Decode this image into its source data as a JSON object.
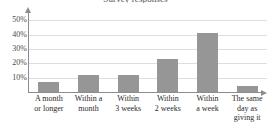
{
  "chart_data": {
    "type": "bar",
    "title": "Survey responses",
    "xlabel": "",
    "ylabel": "",
    "ylim": [
      0,
      55
    ],
    "grid": true,
    "legend": false,
    "y_ticks": [
      "10%",
      "20%",
      "30%",
      "40%",
      "50%"
    ],
    "y_tick_values": [
      10,
      20,
      30,
      40,
      50
    ],
    "categories": [
      "A month or longer",
      "Within a month",
      "Within 3 weeks",
      "Within 2 weeks",
      "Within a week",
      "The same day as giving it"
    ],
    "category_lines": [
      [
        "A month",
        "or longer"
      ],
      [
        "Within a",
        "month"
      ],
      [
        "Within",
        "3 weeks"
      ],
      [
        "Within",
        "2 weeks"
      ],
      [
        "Within",
        "a week"
      ],
      [
        "The same",
        "day as",
        "giving it"
      ]
    ],
    "values": [
      7,
      12,
      12,
      23,
      41,
      4
    ],
    "bar_color": "#969696",
    "grid_color": "#dedede",
    "axis_color": "#8c8c8c",
    "text_color": "#2b2b2b"
  }
}
